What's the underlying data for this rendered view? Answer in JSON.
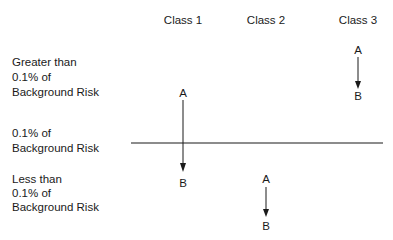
{
  "columns": [
    {
      "label": "Class 1",
      "x": 183
    },
    {
      "label": "Class 2",
      "x": 266
    },
    {
      "label": "Class 3",
      "x": 358
    }
  ],
  "row_labels": {
    "upper": [
      "Greater than",
      "0.1% of",
      "Background Risk"
    ],
    "threshold": [
      "0.1% of",
      "Background Risk"
    ],
    "lower": [
      "Less than",
      "0.1% of",
      "Background Risk"
    ]
  },
  "arrows": [
    {
      "column": "Class 1",
      "from": "A",
      "to": "B",
      "from_region": "Greater than 0.1% of Background Risk",
      "to_region": "Less than 0.1% of Background Risk"
    },
    {
      "column": "Class 2",
      "from": "A",
      "to": "B",
      "from_region": "Less than 0.1% of Background Risk",
      "to_region": "Less than 0.1% of Background Risk"
    },
    {
      "column": "Class 3",
      "from": "A",
      "to": "B",
      "from_region": "Greater than 0.1% of Background Risk",
      "to_region": "Greater than 0.1% of Background Risk"
    }
  ],
  "colors": {
    "ink": "#1a1a1a",
    "background": "#ffffff"
  }
}
